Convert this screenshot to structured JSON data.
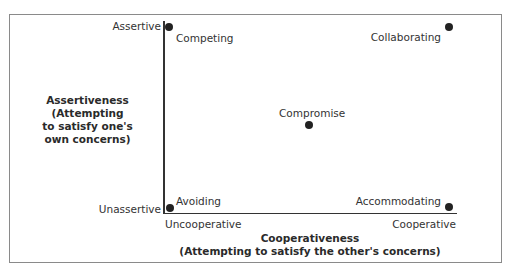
{
  "diagram": {
    "y_axis": {
      "label_lines": [
        "Assertiveness",
        "(Attempting",
        "to satisfy one's",
        "own concerns)"
      ],
      "high": "Assertive",
      "low": "Unassertive"
    },
    "x_axis": {
      "label_lines": [
        "Cooperativeness",
        "(Attempting to satisfy the other's concerns)"
      ],
      "low": "Uncooperative",
      "high": "Cooperative"
    },
    "styles": [
      {
        "name": "Competing",
        "assertiveness": "high",
        "cooperativeness": "low"
      },
      {
        "name": "Collaborating",
        "assertiveness": "high",
        "cooperativeness": "high"
      },
      {
        "name": "Compromise",
        "assertiveness": "medium",
        "cooperativeness": "medium"
      },
      {
        "name": "Avoiding",
        "assertiveness": "low",
        "cooperativeness": "low"
      },
      {
        "name": "Accommodating",
        "assertiveness": "low",
        "cooperativeness": "high"
      }
    ],
    "colors": {
      "dot": "#222222",
      "axis": "#333333",
      "frame": "#8a8a8a",
      "text": "#333333"
    }
  }
}
